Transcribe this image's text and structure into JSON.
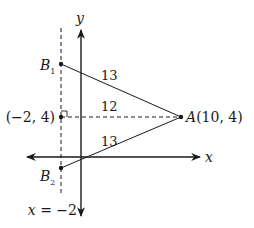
{
  "diagram": {
    "axes": {
      "x_label": "x",
      "y_label": "y"
    },
    "line_label": "x = −2",
    "points": {
      "B1": {
        "letter": "B",
        "sub": "1"
      },
      "B2": {
        "letter": "B",
        "sub": "2"
      },
      "M": {
        "label": "(−2, 4)"
      },
      "A": {
        "letter": "A",
        "coords": "(10, 4)"
      }
    },
    "segment_lengths": {
      "AB1": "13",
      "AM": "12",
      "AB2": "13"
    },
    "colors": {
      "stroke": "#1a1a1a",
      "background": "#ffffff"
    }
  }
}
